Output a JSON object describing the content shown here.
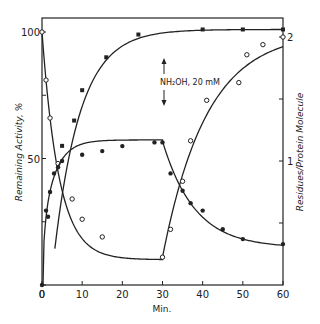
{
  "chart_data": {
    "type": "line",
    "title": "",
    "xlabel": "Min.",
    "ylabel": "Remaining Activity, %",
    "ylabel_right": "Residues/Protein Molecule",
    "xlim": [
      0,
      60
    ],
    "ylim": [
      0,
      105
    ],
    "ylim_right": [
      0,
      2.1
    ],
    "x_ticks": [
      "0",
      "10",
      "20",
      "30",
      "40",
      "50",
      "60"
    ],
    "y_ticks": [
      "0",
      "50",
      "100"
    ],
    "y_ticks_right": [
      "1",
      "2"
    ],
    "grid": false,
    "annotations": [
      {
        "text": "NH₂OH, 20 mM",
        "x": 30,
        "y": 80,
        "arrows": "up-down"
      }
    ],
    "series": [
      {
        "name": "Remaining activity (open circles)",
        "axis": "left",
        "marker": "open-circle",
        "x": [
          0,
          1,
          2,
          4,
          7.5,
          10,
          15,
          30,
          32,
          35,
          37,
          41,
          49,
          51,
          55,
          60
        ],
        "y": [
          100,
          81,
          66,
          48,
          34,
          26,
          19,
          11,
          22,
          41,
          57,
          73,
          80,
          91,
          95,
          98
        ]
      },
      {
        "name": "Remaining activity (filled squares)",
        "axis": "left",
        "marker": "filled-square",
        "x": [
          5,
          8,
          10,
          16,
          24,
          40,
          50,
          60
        ],
        "y": [
          55,
          65,
          77,
          90,
          99,
          101,
          101,
          101
        ]
      },
      {
        "name": "Residues per protein molecule (filled circles)",
        "axis": "right",
        "marker": "filled-circle",
        "x": [
          0,
          1,
          1.5,
          2,
          3,
          4,
          5,
          10,
          15,
          20,
          28,
          30,
          32,
          35,
          37,
          40,
          45,
          50,
          60
        ],
        "y": [
          0,
          0.6,
          0.55,
          0.75,
          0.9,
          0.95,
          1.0,
          1.05,
          1.08,
          1.12,
          1.15,
          1.15,
          0.9,
          0.76,
          0.66,
          0.6,
          0.45,
          0.37,
          0.33
        ]
      }
    ]
  }
}
